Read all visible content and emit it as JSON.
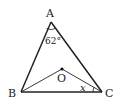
{
  "figure": {
    "type": "geometry-triangle",
    "points": {
      "A": {
        "label": "A",
        "x": 51,
        "y": 22
      },
      "B": {
        "label": "B",
        "x": 21,
        "y": 92
      },
      "C": {
        "label": "C",
        "x": 102,
        "y": 92
      },
      "O": {
        "label": "O",
        "x": 62,
        "y": 69
      }
    },
    "segments": [
      {
        "from": "A",
        "to": "B",
        "weight": "thick"
      },
      {
        "from": "A",
        "to": "C",
        "weight": "thick"
      },
      {
        "from": "B",
        "to": "C",
        "weight": "thick"
      },
      {
        "from": "B",
        "to": "O",
        "weight": "thin"
      },
      {
        "from": "O",
        "to": "C",
        "weight": "thin"
      }
    ],
    "angles": [
      {
        "vertex": "A",
        "label": "62°"
      },
      {
        "vertex": "C",
        "between": [
          "O",
          "B"
        ],
        "label": "x"
      }
    ],
    "colors": {
      "stroke": "#222222",
      "background": "#ffffff"
    }
  }
}
